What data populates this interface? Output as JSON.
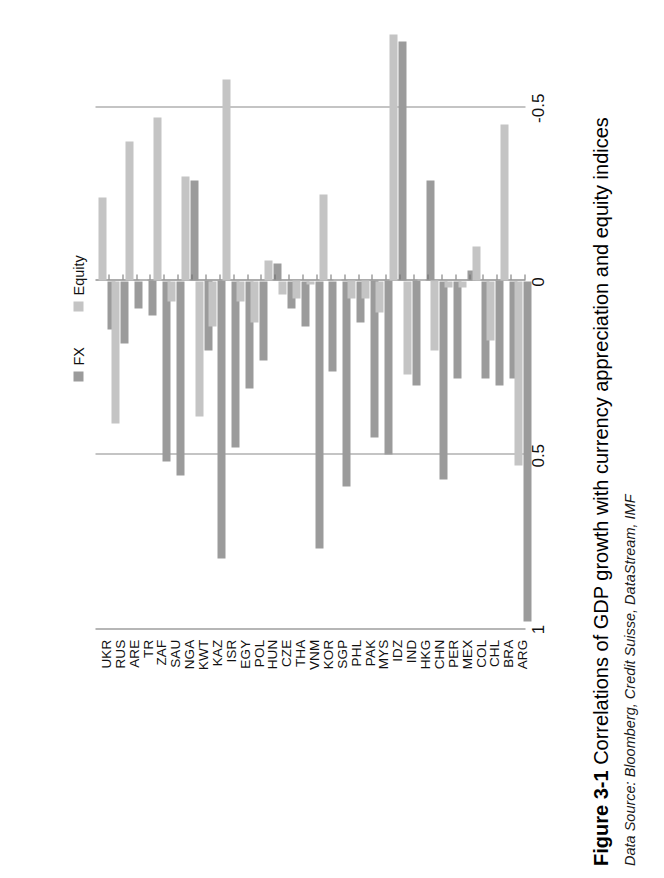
{
  "figure": {
    "number": "Figure 3-1",
    "caption": "Correlations of GDP growth with currency appreciation and equity indices",
    "source": "Data Source: Bloomberg, Credit Suisse, DataStream, IMF"
  },
  "legend": {
    "position": "top-left",
    "items": [
      {
        "label": "FX",
        "color": "#9b9b9b"
      },
      {
        "label": "Equity",
        "color": "#c4c4c4"
      }
    ]
  },
  "axis": {
    "ticks": [
      "1",
      "0.5",
      "0",
      "-0.5",
      "-1"
    ],
    "tick_values": [
      1,
      0.5,
      0,
      -0.5,
      -1
    ],
    "min": -1,
    "max": 1,
    "direction": "descending-left-to-right",
    "gridlines": [
      0.5,
      -0.5
    ]
  },
  "chart_data": {
    "type": "bar",
    "orientation": "horizontal",
    "title": "Correlations of GDP growth with currency appreciation and equity indices",
    "xlabel": "",
    "ylabel": "",
    "xlim": [
      1,
      -1
    ],
    "grid": true,
    "legend_position": "top-left",
    "categories": [
      "ARG",
      "BRA",
      "CHL",
      "COL",
      "MEX",
      "PER",
      "CHN",
      "HKG",
      "IND",
      "IDZ",
      "MYS",
      "PAK",
      "PHL",
      "SGP",
      "KOR",
      "VNM",
      "THA",
      "CZE",
      "HUN",
      "POL",
      "EGY",
      "ISR",
      "KAZ",
      "KWT",
      "NGA",
      "SAU",
      "ZAF",
      "TR",
      "ARE",
      "RUS",
      "UKR"
    ],
    "series": [
      {
        "name": "FX",
        "color": "#9b9b9b",
        "values": [
          0.98,
          0.28,
          0.3,
          0.28,
          -0.03,
          0.28,
          0.57,
          -0.29,
          0.3,
          -0.69,
          0.5,
          0.45,
          0.12,
          0.59,
          0.26,
          0.77,
          0.13,
          0.08,
          -0.05,
          0.23,
          0.31,
          0.48,
          0.8,
          0.2,
          -0.29,
          0.56,
          0.52,
          0.1,
          0.08,
          0.18,
          0.14
        ]
      },
      {
        "name": "Equity",
        "color": "#c4c4c4",
        "values": [
          0.53,
          -0.45,
          0.17,
          -0.1,
          0.02,
          0.02,
          0.2,
          0.0,
          0.27,
          -0.71,
          0.09,
          0.05,
          0.05,
          0.0,
          -0.25,
          0.01,
          0.05,
          0.04,
          -0.06,
          0.12,
          0.06,
          -0.58,
          0.13,
          0.39,
          -0.3,
          0.06,
          -0.47,
          0.0,
          -0.4,
          0.41,
          -0.24
        ]
      }
    ]
  }
}
